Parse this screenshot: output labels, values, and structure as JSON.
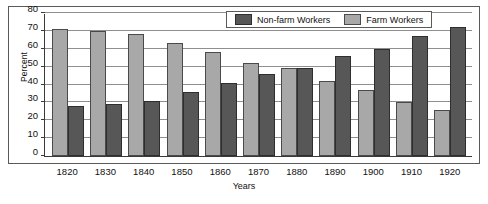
{
  "chart_data": {
    "type": "bar",
    "title": "",
    "xlabel": "Years",
    "ylabel": "Percent",
    "ylim": [
      0,
      80
    ],
    "ytick_step": 10,
    "grid": true,
    "legend_position": "top-right",
    "categories": [
      "1820",
      "1830",
      "1840",
      "1850",
      "1860",
      "1870",
      "1880",
      "1890",
      "1900",
      "1910",
      "1920"
    ],
    "series": [
      {
        "name": "Farm Workers",
        "color": "#a8a8a8",
        "values": [
          71,
          70,
          68,
          63,
          58,
          52,
          49,
          42,
          37,
          30,
          26
        ]
      },
      {
        "name": "Non-farm Workers",
        "color": "#575757",
        "values": [
          28,
          29,
          31,
          36,
          41,
          46,
          49,
          56,
          60,
          67,
          72
        ]
      }
    ],
    "yticks": [
      "0",
      "10",
      "20",
      "30",
      "40",
      "50",
      "60",
      "70",
      "80"
    ]
  },
  "legend": {
    "items": [
      {
        "label": "Non-farm Workers",
        "color": "#575757",
        "swatch": "nonfarm"
      },
      {
        "label": "Farm Workers",
        "color": "#a8a8a8",
        "swatch": "farm"
      }
    ]
  },
  "colors": {
    "farm": "#a8a8a8",
    "nonfarm": "#575757",
    "axis": "#3a3a3a",
    "grid": "#8f8f8f",
    "frame": "#5a5a5a",
    "background": "#ffffff"
  }
}
